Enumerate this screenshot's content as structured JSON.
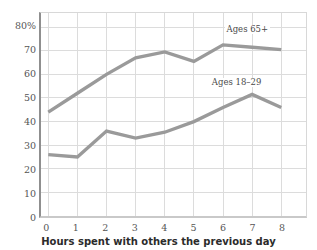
{
  "chart_data": {
    "type": "line",
    "title": "",
    "subtitle": "",
    "xlabel": "Hours spent with others the previous day",
    "ylabel": "",
    "x": [
      0,
      1,
      2,
      3,
      4,
      5,
      6,
      7,
      8
    ],
    "xtick_labels": [
      "0",
      "1",
      "2",
      "3",
      "4",
      "5",
      "6",
      "7",
      "8"
    ],
    "ytick_labels": [
      "0",
      "10",
      "20",
      "30",
      "40",
      "50",
      "60",
      "70",
      "80%"
    ],
    "ytick_values": [
      0,
      10,
      20,
      30,
      40,
      50,
      60,
      70,
      80
    ],
    "xlim": [
      -0.25,
      8.85
    ],
    "ylim": [
      0,
      86
    ],
    "grid": true,
    "legend_position": "inline-annotation",
    "series": [
      {
        "name": "Ages 65+",
        "values": [
          44,
          52,
          60,
          67,
          69.5,
          65.5,
          72.5,
          71.5,
          70.5
        ],
        "color": "#9a9a9a",
        "label_x": 6.05,
        "label_y": 78.5
      },
      {
        "name": "Ages 18–29",
        "values": [
          26,
          25,
          36,
          33,
          35.5,
          40,
          46,
          51.5,
          46
        ],
        "color": "#9a9a9a",
        "label_x": 5.55,
        "label_y": 56.5
      }
    ],
    "colors": {
      "line": "#9a9a9a",
      "grid": "#dcdcdc",
      "axis": "#8f8f8f",
      "tick_text": "#555555",
      "title_text": "#2b2b2b",
      "background": "#ffffff"
    }
  }
}
